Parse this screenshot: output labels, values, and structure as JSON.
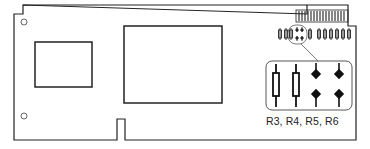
{
  "diagram": {
    "callout_label": "R3, R4, R5, R6",
    "components": {
      "chip_small": "small-ic-chip",
      "chip_large": "large-ic-chip",
      "edge_connector": "edge-connector",
      "resistor_row_count": 12,
      "callout_items": [
        "R3",
        "R4",
        "R5",
        "R6"
      ]
    },
    "colors": {
      "stroke": "#222222",
      "background": "#ffffff"
    }
  }
}
